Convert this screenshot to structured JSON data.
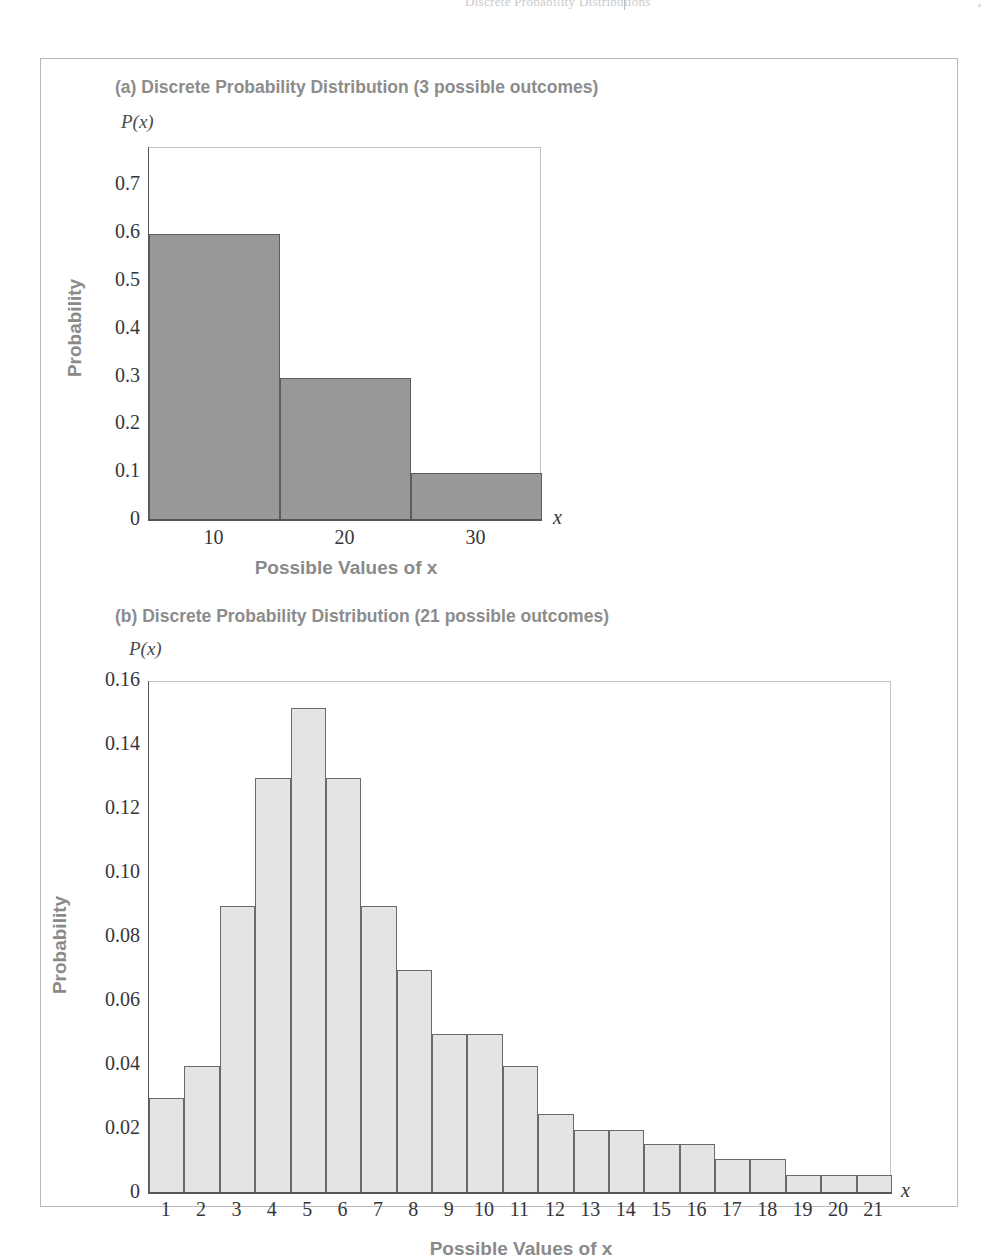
{
  "page_header": {
    "text": "Discrete Probability Distributions",
    "divider": "|"
  },
  "figure": {
    "panels": [
      {
        "id": "a",
        "title": "(a) Discrete Probability Distribution (3 possible outcomes)",
        "y_axis_name": "P(x)",
        "y_axis_label": "Probability",
        "x_axis_label": "Possible Values of x",
        "x_axis_var": "x",
        "bar_fill": "#989898",
        "bar_stroke": "#5d5d5d"
      },
      {
        "id": "b",
        "title": "(b) Discrete Probability Distribution (21 possible outcomes)",
        "y_axis_name": "P(x)",
        "y_axis_label": "Probability",
        "x_axis_label": "Possible Values of x",
        "x_axis_var": "x",
        "bar_fill": "#e4e4e4",
        "bar_stroke": "#6a6a6a"
      }
    ]
  },
  "chart_data": [
    {
      "type": "bar",
      "panel": "a",
      "title": "(a) Discrete Probability Distribution (3 possible outcomes)",
      "xlabel": "Possible Values of x",
      "ylabel": "Probability",
      "y_axis_name": "P(x)",
      "x_axis_var": "x",
      "categories": [
        "10",
        "20",
        "30"
      ],
      "values": [
        0.6,
        0.3,
        0.1
      ],
      "ylim": [
        0,
        0.78
      ],
      "yticks": [
        0,
        0.1,
        0.2,
        0.3,
        0.4,
        0.5,
        0.6,
        0.7
      ],
      "ytick_labels": [
        "0",
        "0.1",
        "0.2",
        "0.3",
        "0.4",
        "0.5",
        "0.6",
        "0.7"
      ],
      "grid": false,
      "legend": "none",
      "bar_gap": 0
    },
    {
      "type": "bar",
      "panel": "b",
      "title": "(b) Discrete Probability Distribution (21 possible outcomes)",
      "xlabel": "Possible Values of x",
      "ylabel": "Probability",
      "y_axis_name": "P(x)",
      "x_axis_var": "x",
      "categories": [
        "1",
        "2",
        "3",
        "4",
        "5",
        "6",
        "7",
        "8",
        "9",
        "10",
        "11",
        "12",
        "13",
        "14",
        "15",
        "16",
        "17",
        "18",
        "19",
        "20",
        "21"
      ],
      "values": [
        0.03,
        0.04,
        0.09,
        0.13,
        0.152,
        0.13,
        0.09,
        0.07,
        0.05,
        0.05,
        0.04,
        0.025,
        0.02,
        0.02,
        0.0155,
        0.0155,
        0.011,
        0.011,
        0.006,
        0.006,
        0.006
      ],
      "ylim": [
        0,
        0.16
      ],
      "yticks": [
        0,
        0.02,
        0.04,
        0.06,
        0.08,
        0.1,
        0.12,
        0.14,
        0.16
      ],
      "ytick_labels": [
        "0",
        "0.02",
        "0.04",
        "0.06",
        "0.08",
        "0.10",
        "0.12",
        "0.14",
        "0.16"
      ],
      "grid": false,
      "legend": "none",
      "bar_gap": 0
    }
  ]
}
